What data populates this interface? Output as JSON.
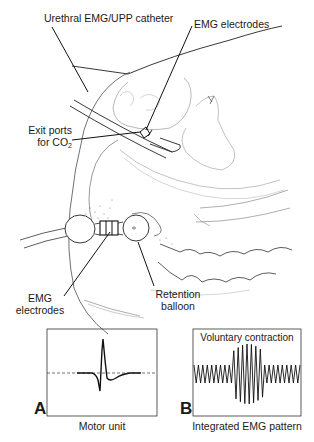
{
  "figure": {
    "labels": {
      "urethral_catheter": "Urethral EMG/UPP catheter",
      "emg_electrodes_top": "EMG electrodes",
      "exit_ports_line1": "Exit ports",
      "exit_ports_line2": "for CO",
      "exit_ports_sub": "2",
      "emg_electrodes_bottom_line1": "EMG",
      "emg_electrodes_bottom_line2": "electrodes",
      "retention_line1": "Retention",
      "retention_line2": "balloon"
    },
    "panels": [
      {
        "letter": "A",
        "caption": "Motor unit",
        "title": ""
      },
      {
        "letter": "B",
        "caption": "Integrated EMG pattern",
        "title": "Voluntary contraction"
      }
    ],
    "colors": {
      "ink": "#1a1a1a",
      "faint": "#8a8a8a",
      "background": "#ffffff"
    }
  }
}
